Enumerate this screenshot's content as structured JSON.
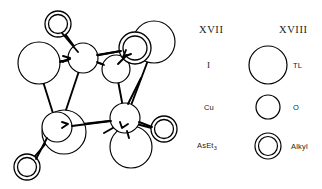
{
  "figure": {
    "type": "chemical-structure-legend",
    "structure_label": "XVII",
    "legend_label": "XVIII",
    "background_color": "#ffffff",
    "line_color": "#000000"
  },
  "columns": {
    "left_heading": "XVII",
    "right_heading": "XVIII"
  },
  "legend_rows": [
    {
      "left_label": "I",
      "right_label": "TL",
      "symbol": "large-open-circle",
      "radius": 19
    },
    {
      "left_label": "Cu",
      "right_label": "O",
      "symbol": "small-open-circle",
      "radius": 12
    },
    {
      "left_label": "AsEt",
      "left_label_sub": "3",
      "right_label": "Alkyl",
      "symbol": "double-ring-circle",
      "radius": 13
    }
  ],
  "structure": {
    "atoms": [
      {
        "id": "a1",
        "kind": "double-ring",
        "cx": 58,
        "cy": 24,
        "r": 13,
        "r_inner": 9.5,
        "name": "alkyl-group-top-left"
      },
      {
        "id": "a2",
        "kind": "large",
        "cx": 39,
        "cy": 63,
        "r": 21,
        "name": "iodine-left"
      },
      {
        "id": "a3",
        "kind": "small",
        "cx": 83,
        "cy": 58,
        "r": 15,
        "name": "copper-upper-left"
      },
      {
        "id": "a4",
        "kind": "double-ring",
        "cx": 135,
        "cy": 48,
        "r": 16,
        "r_inner": 12,
        "name": "alkyl-group-top-right"
      },
      {
        "id": "a5",
        "kind": "large",
        "cx": 154,
        "cy": 42,
        "r": 21,
        "name": "iodine-top-right"
      },
      {
        "id": "a6",
        "kind": "small",
        "cx": 116,
        "cy": 69,
        "r": 14,
        "name": "copper-upper-right"
      },
      {
        "id": "a7",
        "kind": "large",
        "cx": 64,
        "cy": 132,
        "r": 22,
        "name": "iodine-lower-left"
      },
      {
        "id": "a8",
        "kind": "small",
        "cx": 57,
        "cy": 127,
        "r": 15,
        "name": "copper-lower-left"
      },
      {
        "id": "a9",
        "kind": "small",
        "cx": 125,
        "cy": 118,
        "r": 15,
        "name": "copper-lower-right"
      },
      {
        "id": "a10",
        "kind": "large",
        "cx": 131,
        "cy": 147,
        "r": 21,
        "name": "iodine-bottom"
      },
      {
        "id": "a11",
        "kind": "double-ring",
        "cx": 27,
        "cy": 167,
        "r": 13,
        "r_inner": 9.5,
        "name": "alkyl-group-bottom-left"
      },
      {
        "id": "a12",
        "kind": "double-ring",
        "cx": 164,
        "cy": 129,
        "r": 13,
        "r_inner": 9.5,
        "name": "alkyl-group-right"
      }
    ],
    "bonds": [
      {
        "from": "a1",
        "to": "a3",
        "name": "bond-alkyl-cu-upper-left"
      },
      {
        "from": "a2",
        "to": "a3",
        "name": "bond-i-cu-left"
      },
      {
        "from": "a3",
        "to": "a6",
        "name": "bond-cu-cu-top"
      },
      {
        "from": "a3",
        "to": "a5",
        "name": "bond-cu-i-topright"
      },
      {
        "from": "a6",
        "to": "a4",
        "name": "bond-cu-alkyl-right"
      },
      {
        "from": "a2",
        "to": "a8",
        "name": "bond-i-cu-leftdown"
      },
      {
        "from": "a3",
        "to": "a8",
        "name": "bond-cu-cu-left-vertical"
      },
      {
        "from": "a6",
        "to": "a9",
        "name": "bond-cu-cu-right-vertical"
      },
      {
        "from": "a8",
        "to": "a9",
        "name": "bond-cu-cu-bottom"
      },
      {
        "from": "a8",
        "to": "a11",
        "name": "bond-cu-alkyl-bottom-left"
      },
      {
        "from": "a9",
        "to": "a10",
        "name": "bond-cu-i-bottom"
      },
      {
        "from": "a9",
        "to": "a12",
        "name": "bond-cu-alkyl-right-lower"
      },
      {
        "from": "a5",
        "to": "a9",
        "name": "bond-i-cu-right"
      }
    ]
  }
}
